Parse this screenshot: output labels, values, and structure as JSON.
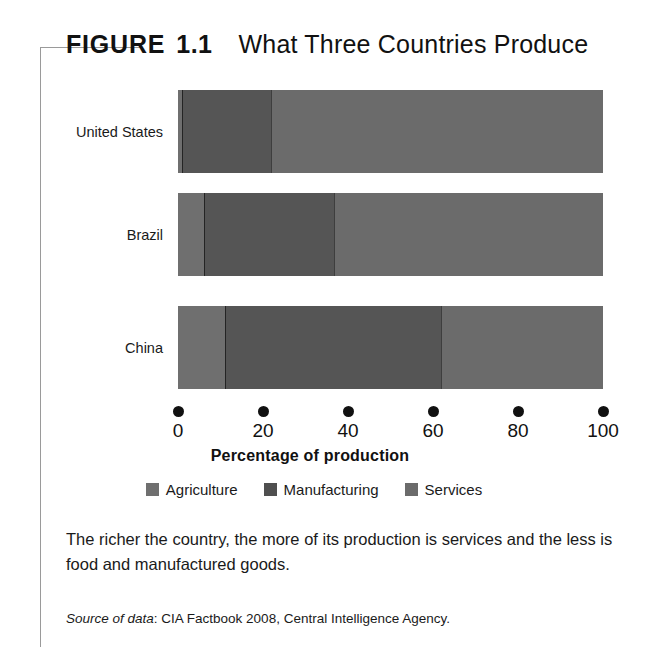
{
  "figure": {
    "label": "FIGURE",
    "number": "1.1",
    "title": "What Three Countries Produce"
  },
  "caption": "The richer the country, the more of its production is services and the less is food and manufactured goods.",
  "source": {
    "lead": "Source of data",
    "text": ": CIA Factbook 2008, Central Intelligence Agency."
  },
  "colors": {
    "agriculture": "#6f6f6f",
    "manufacturing": "#555555",
    "services": "#6b6b6b",
    "axis": "#111111",
    "bracket": "#9a9a9a"
  },
  "chart_data": {
    "type": "bar",
    "orientation": "horizontal",
    "stacked": true,
    "title": "What Three Countries Produce",
    "xlabel": "Percentage of production",
    "ylabel": "",
    "xlim": [
      0,
      100
    ],
    "xticks": [
      0,
      20,
      40,
      60,
      80,
      100
    ],
    "xtick_labels": [
      "0",
      "20",
      "40",
      "60",
      "80",
      "100"
    ],
    "grid": false,
    "legend_position": "bottom",
    "categories": [
      "United States",
      "Brazil",
      "China"
    ],
    "series": [
      {
        "name": "Agriculture",
        "values": [
          1,
          6,
          11
        ]
      },
      {
        "name": "Manufacturing",
        "values": [
          21,
          31,
          51
        ]
      },
      {
        "name": "Services",
        "values": [
          78,
          63,
          38
        ]
      }
    ],
    "annotations": []
  }
}
